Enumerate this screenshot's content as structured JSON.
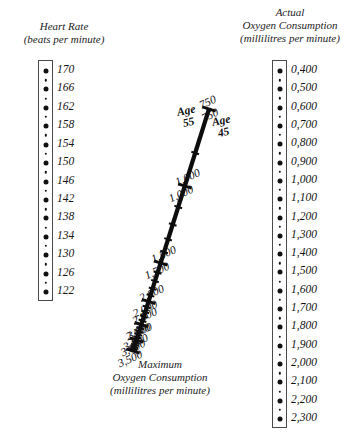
{
  "figure": {
    "kind": "nomogram",
    "background_color": "#ffffff",
    "ink_color": "#111111"
  },
  "heart_rate_axis": {
    "title_line1": "Heart Rate",
    "title_line2": "(beats per minute)",
    "unit": "beats per minute",
    "labels": [
      "170",
      "166",
      "162",
      "158",
      "154",
      "150",
      "146",
      "142",
      "138",
      "134",
      "130",
      "126",
      "122"
    ],
    "values": [
      170,
      166,
      162,
      158,
      154,
      150,
      146,
      142,
      138,
      134,
      130,
      126,
      122
    ],
    "minor_step": 2,
    "orientation": "vertical-descending"
  },
  "actual_oxygen_axis": {
    "title_line1": "Actual",
    "title_line2": "Oxygen Consumption",
    "title_line3": "(millilitres per minute)",
    "unit": "millilitres per minute",
    "labels": [
      "0,400",
      "0,500",
      "0,600",
      "0,700",
      "0,800",
      "0,900",
      "1,000",
      "1,100",
      "1,200",
      "1,300",
      "1,400",
      "1,500",
      "1,600",
      "1,700",
      "1,800",
      "1,900",
      "2,000",
      "2,100",
      "2,200",
      "2,300"
    ],
    "values": [
      400,
      500,
      600,
      700,
      800,
      900,
      1000,
      1100,
      1200,
      1300,
      1400,
      1500,
      1600,
      1700,
      1800,
      1900,
      2000,
      2100,
      2200,
      2300
    ],
    "minor_step": 50,
    "orientation": "vertical-ascending"
  },
  "maximum_oxygen_axis": {
    "title_line1": "Maximum",
    "title_line2": "Oxygen Consumption",
    "title_line3": "(millilitres per minute)",
    "unit": "millilitres per minute",
    "age_left_word": "Age",
    "age_left_value": "55",
    "age_right_word": "Age",
    "age_right_value": "45",
    "labels": [
      "750",
      "1,000",
      "1,500",
      "2,000",
      "2,500",
      "3,000",
      "3,500"
    ],
    "values": [
      750,
      1000,
      1500,
      2000,
      2500,
      3000,
      3500
    ],
    "orientation": "diagonal-descending"
  },
  "chart_data": {
    "type": "table",
    "scales": [
      {
        "name": "Heart Rate",
        "unit": "beats per minute",
        "position": "left",
        "tick_labels": [
          "170",
          "166",
          "162",
          "158",
          "154",
          "150",
          "146",
          "142",
          "138",
          "134",
          "130",
          "126",
          "122"
        ],
        "tick_values": [
          170,
          166,
          162,
          158,
          154,
          150,
          146,
          142,
          138,
          134,
          130,
          126,
          122
        ],
        "range": [
          122,
          170
        ],
        "step": 4,
        "minor_step": 2,
        "direction": "top-to-bottom decreasing"
      },
      {
        "name": "Maximum Oxygen Consumption",
        "unit": "millilitres per minute",
        "position": "center-diagonal",
        "tick_labels": [
          "750",
          "1,000",
          "1,500",
          "2,000",
          "2,500",
          "3,000",
          "3,500"
        ],
        "tick_values": [
          750,
          1000,
          1500,
          2000,
          2500,
          3000,
          3500
        ],
        "range": [
          750,
          3500
        ],
        "direction": "top-to-bottom increasing",
        "dual_labeling": [
          {
            "side": "left",
            "legend": "Age 55"
          },
          {
            "side": "right",
            "legend": "Age 45"
          }
        ]
      },
      {
        "name": "Actual Oxygen Consumption",
        "unit": "millilitres per minute",
        "position": "right",
        "tick_labels": [
          "0,400",
          "0,500",
          "0,600",
          "0,700",
          "0,800",
          "0,900",
          "1,000",
          "1,100",
          "1,200",
          "1,300",
          "1,400",
          "1,500",
          "1,600",
          "1,700",
          "1,800",
          "1,900",
          "2,000",
          "2,100",
          "2,200",
          "2,300"
        ],
        "tick_values": [
          400,
          500,
          600,
          700,
          800,
          900,
          1000,
          1100,
          1200,
          1300,
          1400,
          1500,
          1600,
          1700,
          1800,
          1900,
          2000,
          2100,
          2200,
          2300
        ],
        "range": [
          400,
          2300
        ],
        "step": 100,
        "minor_step": 50,
        "direction": "top-to-bottom increasing"
      }
    ],
    "grid": false,
    "legend": "none"
  }
}
